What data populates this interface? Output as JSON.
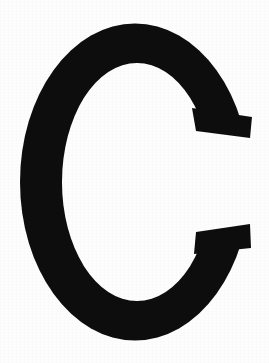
{
  "image": {
    "kind": "scanned-letterform",
    "character": "C",
    "description": "Large black uppercase letter C on a plain white background",
    "width": 269,
    "height": 363
  },
  "colors": {
    "background": "#fdfdfd",
    "glyph_fill": "#0d0d0d",
    "page_white": "#ffffff"
  },
  "glyph": {
    "character": "C",
    "case": "uppercase",
    "style": "serif-didone",
    "bounds": {
      "left": 20,
      "top": 23,
      "right": 250,
      "bottom": 340,
      "width": 230,
      "height": 317
    },
    "stroke": {
      "stem_thickness": 42,
      "bowl_thin_thickness": 38
    },
    "aperture": {
      "side": "right",
      "upper_terminal_end_y": 135,
      "lower_terminal_start_y": 233,
      "terminal_cut": "diagonal"
    },
    "counter": {
      "left": 62,
      "top": 63,
      "right": 212,
      "bottom": 300
    },
    "outer_path": "M 212 105 C 210 60 168 24 129 23 C 72 23 20 86 20 182 C 20 278 72 340 129 340 C 170 340 212 302 217 254 L 250 240 C 248 300 190 347 129 348 C 56 348 4 278 4 182 C 4 86 56 15 129 16 C 188 16 243 62 248 122 Z",
    "path": "M 211 108 C 205 62 170 30 131 30 C 79 30 38 98 38 182 C 38 266 79 333 131 333 C 169 333 203 303 211 259 L 249 243 C 243 303 191 345 131 345 C 61 345 20 276 20 182 C 20 88 61 19 131 19 C 188 19 238 62 246 120 Z"
  },
  "accessibility": {
    "alt_text": "Black capital letter C"
  }
}
